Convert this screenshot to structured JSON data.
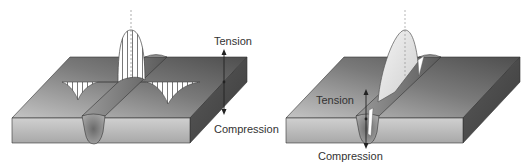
{
  "left_panel": {
    "tension_label": "Tension",
    "compression_label": "Compression"
  },
  "right_panel": {
    "tension_label": "Tension",
    "compression_label": "Compression"
  },
  "colors": {
    "plate_top_dark": "#5a5a5a",
    "plate_top_light": "#b5b5b5",
    "plate_front": "#bdbdbd",
    "plate_side": "#6e6e6e",
    "weld_bead": "#7a7a7a",
    "stress_curve_fill": "#ffffff",
    "stress_curve_stroke": "#444444"
  }
}
